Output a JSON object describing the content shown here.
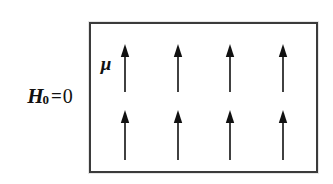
{
  "figure": {
    "name": "magnetic-moments-zero-field-diagram",
    "background_color": "#ffffff",
    "ink_color": "#111111",
    "border_color": "#3b3b3b"
  },
  "field_label": {
    "symbol": "H",
    "subscript": "0",
    "equals": "=",
    "value": "0",
    "full_text": "H0=0",
    "meaning": "applied-field-is-zero"
  },
  "sample_box": {
    "label": "sample-region",
    "x": 89,
    "y": 22,
    "width": 229,
    "height": 151,
    "border_width": 2
  },
  "moment_label": {
    "symbol": "μ",
    "meaning": "magnetic-moment"
  },
  "moments": {
    "columns": 4,
    "rows": 2,
    "direction": "up",
    "count": 8,
    "column_x": [
      125,
      178,
      230,
      283
    ],
    "row_top": {
      "tip_y": 44,
      "tail_y": 92
    },
    "row_bottom": {
      "tip_y": 110,
      "tail_y": 160
    },
    "arrows": [
      {
        "id": "moment-r1-c1",
        "x": 125,
        "tip_y": 44,
        "tail_y": 92,
        "direction": "up"
      },
      {
        "id": "moment-r1-c2",
        "x": 178,
        "tip_y": 44,
        "tail_y": 92,
        "direction": "up"
      },
      {
        "id": "moment-r1-c3",
        "x": 230,
        "tip_y": 44,
        "tail_y": 92,
        "direction": "up"
      },
      {
        "id": "moment-r1-c4",
        "x": 283,
        "tip_y": 44,
        "tail_y": 92,
        "direction": "up"
      },
      {
        "id": "moment-r2-c1",
        "x": 125,
        "tip_y": 110,
        "tail_y": 160,
        "direction": "up"
      },
      {
        "id": "moment-r2-c2",
        "x": 178,
        "tip_y": 110,
        "tail_y": 160,
        "direction": "up"
      },
      {
        "id": "moment-r2-c3",
        "x": 230,
        "tip_y": 110,
        "tail_y": 160,
        "direction": "up"
      },
      {
        "id": "moment-r2-c4",
        "x": 283,
        "tip_y": 110,
        "tail_y": 160,
        "direction": "up"
      }
    ],
    "head_half_width": 4.2,
    "head_length": 13,
    "shaft_width": 1.6
  }
}
